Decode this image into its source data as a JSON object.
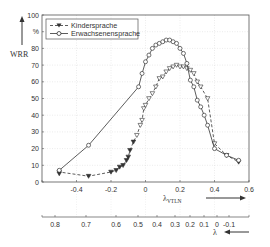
{
  "chart_data": {
    "type": "line",
    "title": "",
    "ylabel": "WRR",
    "yunit": "%",
    "xlabel": "λ_VTLN",
    "xlabel_secondary": "λ",
    "xlim": [
      -0.6,
      0.6
    ],
    "ylim": [
      0,
      100
    ],
    "grid": true,
    "legend_position": "upper left",
    "x_ticks": [
      -0.4,
      -0.2,
      0,
      0.2,
      0.4,
      0.6
    ],
    "y_ticks": [
      0,
      10,
      20,
      30,
      40,
      50,
      60,
      70,
      80,
      100
    ],
    "y_tick_labels": [
      "0",
      "10",
      "20",
      "30",
      "40",
      "50",
      "60",
      "70",
      "80",
      "%",
      "100"
    ],
    "secondary_x_ticks": [
      "0.8",
      "0.7",
      "0.6",
      "0.5",
      "0.4",
      "0.3",
      "0.2",
      "0.1",
      "0",
      "-0.1"
    ],
    "series": [
      {
        "name": "Kindersprache",
        "style": "dashed",
        "marker": "triangle-down",
        "x": [
          -0.5,
          -0.5,
          -0.33,
          -0.2,
          -0.17,
          -0.15,
          -0.13,
          -0.11,
          -0.1,
          -0.09,
          -0.07,
          -0.05,
          -0.03,
          -0.02,
          -0.01,
          0.0,
          0.02,
          0.04,
          0.06,
          0.08,
          0.1,
          0.12,
          0.14,
          0.16,
          0.18,
          0.2,
          0.22,
          0.24,
          0.26,
          0.28,
          0.3,
          0.32,
          0.36,
          0.4,
          0.47,
          0.54
        ],
        "values": [
          5,
          6,
          3.5,
          6,
          7,
          9,
          10,
          13,
          15,
          19,
          24,
          28,
          34,
          37,
          44,
          46,
          50,
          53,
          57,
          62,
          63,
          66,
          68,
          69,
          70,
          69,
          69,
          68,
          67,
          65,
          60,
          57,
          50,
          23,
          16,
          12
        ]
      },
      {
        "name": "Erwachsenensprache",
        "style": "solid",
        "marker": "circle",
        "x": [
          -0.5,
          -0.33,
          -0.04,
          -0.02,
          0.0,
          0.02,
          0.04,
          0.06,
          0.08,
          0.1,
          0.12,
          0.14,
          0.16,
          0.18,
          0.2,
          0.22,
          0.24,
          0.26,
          0.28,
          0.3,
          0.32,
          0.34,
          0.36,
          0.4,
          0.47,
          0.54
        ],
        "values": [
          7,
          22,
          57,
          65,
          72,
          76,
          80,
          82,
          83,
          84,
          85,
          85,
          84,
          83,
          80,
          77,
          71,
          61,
          57,
          49,
          45,
          40,
          34,
          20,
          16,
          13
        ]
      }
    ]
  },
  "labels": {
    "ylabel": "WRR",
    "yunit": "%",
    "xlabel_main": "λ",
    "xlabel_sub": "VTLN",
    "xlabel_secondary": "λ",
    "legend_kinder": "Kindersprache",
    "legend_erwachsen": "Erwachsenensprache"
  }
}
